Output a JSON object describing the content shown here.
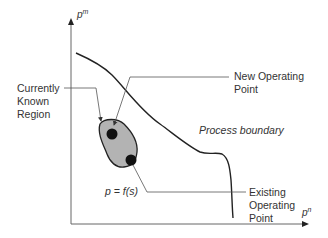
{
  "diagram": {
    "axes": {
      "y_label": "p",
      "y_label_sup": "m",
      "x_label": "p",
      "x_label_sup": "n"
    },
    "labels": {
      "currently_known_region": [
        "Currently",
        "Known",
        "Region"
      ],
      "new_operating_point": [
        "New Operating",
        "Point"
      ],
      "process_boundary": "Process boundary",
      "existing_operating_point": [
        "Existing",
        "Operating",
        "Point"
      ],
      "function": "p = f(s)"
    },
    "colors": {
      "line": "#222222",
      "leader": "#555555",
      "region_fill": "#b3b3b3",
      "point": "#111111",
      "text": "#333333"
    }
  }
}
